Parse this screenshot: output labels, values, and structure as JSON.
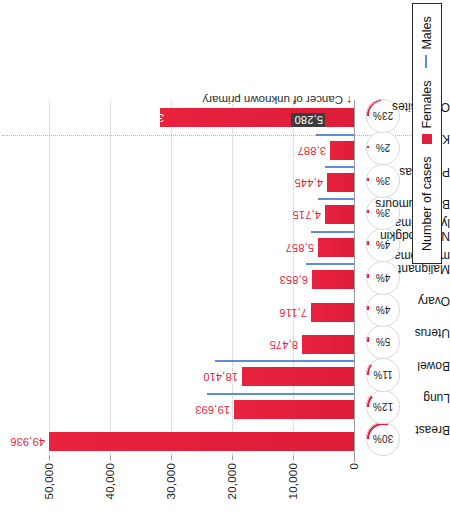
{
  "chart_data": {
    "type": "bar",
    "title": "",
    "xlabel": "",
    "ylabel": "Number of cases",
    "ylim": [
      0,
      55000
    ],
    "yticks": [
      0,
      10000,
      20000,
      30000,
      40000,
      50000
    ],
    "ytick_labels": [
      "0",
      "10,000",
      "20,000",
      "30,000",
      "40,000",
      "50,000"
    ],
    "grid": true,
    "legend_position": "bottom-right",
    "categories": [
      "Breast",
      "Lung",
      "Bowel",
      "Uterus",
      "Ovary",
      "Malignant melanoma",
      "Non-Hodgkin lymphoma",
      "Brain tumours",
      "Pancreas",
      "Kidney",
      "Other sites"
    ],
    "series": [
      {
        "name": "Females",
        "color": "#e31e3c",
        "values": [
          49936,
          19693,
          18410,
          8475,
          7116,
          6853,
          5857,
          4715,
          4445,
          3887,
          31828
        ],
        "value_labels": [
          "49,936",
          "19,693",
          "18,410",
          "8,475",
          "7,116",
          "6,853",
          "5,857",
          "4,715",
          "4,445",
          "3,887",
          "31,828"
        ]
      },
      {
        "name": "Males",
        "color": "#5b8fd4",
        "values": [
          null,
          24000,
          22700,
          null,
          null,
          7800,
          7100,
          5900,
          4800,
          6300,
          null
        ]
      }
    ],
    "percent_labels": [
      "30%",
      "12%",
      "11%",
      "5%",
      "4%",
      "4%",
      "4%",
      "3%",
      "3%",
      "2%",
      "23%"
    ],
    "percent_values": [
      30,
      12,
      11,
      5,
      4,
      4,
      4,
      3,
      3,
      2,
      23
    ],
    "annotations": [
      {
        "text": "Cancer of unknown primary",
        "value": 5280,
        "value_label": "5,280",
        "category": "Other sites"
      }
    ]
  },
  "legend": {
    "axis_title": "Number of cases",
    "females_label": "Females",
    "males_label": "Males"
  }
}
